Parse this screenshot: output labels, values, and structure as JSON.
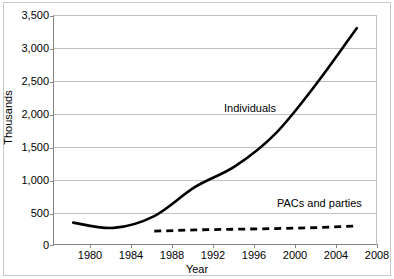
{
  "chart_data": {
    "type": "line",
    "title": "",
    "xlabel": "Year",
    "ylabel": "Thousands",
    "xlim": [
      1979,
      2009
    ],
    "ylim": [
      0,
      3500
    ],
    "grid": true,
    "legend_position": "inline-annotations",
    "categories": [
      1980,
      1984,
      1988,
      1992,
      1996,
      2000,
      2004,
      2008
    ],
    "x_tick_labels": [
      "1980",
      "1984",
      "1988",
      "1992",
      "1996",
      "2000",
      "2004",
      "2008"
    ],
    "y_tick_labels": [
      "0",
      "500",
      "1,000",
      "1,500",
      "2,000",
      "2,500",
      "3,000",
      "3,500"
    ],
    "y_tick_values": [
      0,
      500,
      1000,
      1500,
      2000,
      2500,
      3000,
      3500
    ],
    "series": [
      {
        "name": "Individuals",
        "style": "solid",
        "color": "#000000",
        "x": [
          1980,
          1984,
          1988,
          1992,
          1996,
          2000,
          2004,
          2008
        ],
        "values": [
          340,
          260,
          440,
          880,
          1200,
          1700,
          2450,
          3300
        ]
      },
      {
        "name": "PACs and parties",
        "style": "dashed",
        "color": "#000000",
        "x": [
          1988,
          1992,
          1996,
          2000,
          2004,
          2008
        ],
        "values": [
          210,
          230,
          240,
          250,
          265,
          290
        ]
      }
    ],
    "annotations": [
      {
        "text": "Individuals",
        "near_series": "Individuals"
      },
      {
        "text": "PACs and parties",
        "near_series": "PACs and parties"
      }
    ]
  },
  "labels": {
    "y_axis_title": "Thousands",
    "x_axis_title": "Year",
    "series_individuals": "Individuals",
    "series_pacs": "PACs and parties",
    "y0": "0",
    "y1": "500",
    "y2": "1,000",
    "y3": "1,500",
    "y4": "2,000",
    "y5": "2,500",
    "y6": "3,000",
    "y7": "3,500",
    "x0": "1980",
    "x1": "1984",
    "x2": "1988",
    "x3": "1992",
    "x4": "1996",
    "x5": "2000",
    "x6": "2004",
    "x7": "2008"
  },
  "colors": {
    "line": "#000000",
    "grid": "#c0c0c0",
    "axis": "#858585",
    "frame": "#c8c8c8",
    "background": "#ffffff"
  }
}
